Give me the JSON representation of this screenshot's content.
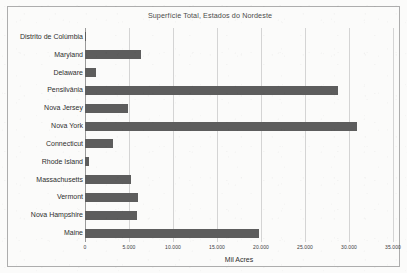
{
  "chart_data": {
    "type": "bar",
    "orientation": "horizontal",
    "title": "Superfície Total, Estados do Nordeste",
    "xlabel": "Mil Acres",
    "ylabel": "",
    "xlim": [
      0,
      35000
    ],
    "xticks": [
      "0",
      "5.000",
      "10.000",
      "15.000",
      "20.000",
      "25.000",
      "30.000",
      "35.000"
    ],
    "xtick_values": [
      0,
      5000,
      10000,
      15000,
      20000,
      25000,
      30000,
      35000
    ],
    "grid": "vertical",
    "legend": "none",
    "bar_color": "#5d5d5d",
    "categories": [
      "Distrito de Colúmbia",
      "Maryland",
      "Delaware",
      "Pensilvânia",
      "Nova Jersey",
      "Nova York",
      "Connecticut",
      "Rhode Island",
      "Massachusetts",
      "Vermont",
      "Nova Hampshire",
      "Maine"
    ],
    "values": [
      40,
      6400,
      1300,
      28800,
      4900,
      30900,
      3200,
      500,
      5200,
      6000,
      5900,
      19800
    ]
  },
  "colors": {
    "bar": "#5d5d5d",
    "gridline": "#d4d4d4",
    "frame": "#adadad",
    "text": "#2e2e2e",
    "title_text": "#4b4b4b",
    "background": "#fbfbfa"
  }
}
